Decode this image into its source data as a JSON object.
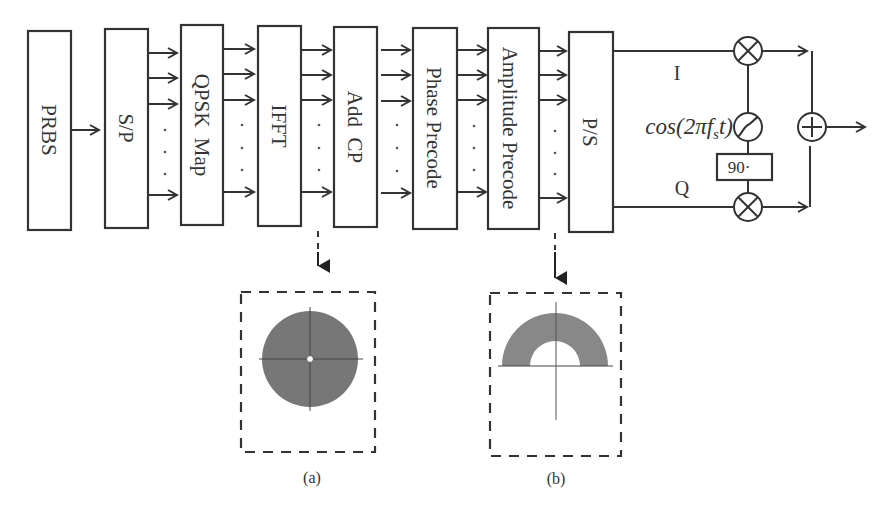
{
  "diagram": {
    "type": "block-diagram",
    "blocks": [
      {
        "id": "prbs",
        "label": "PRBS"
      },
      {
        "id": "sp",
        "label": "S/P"
      },
      {
        "id": "qpsk",
        "label": "QPSK  Map"
      },
      {
        "id": "ifft",
        "label": "IFFT"
      },
      {
        "id": "addcp",
        "label": "Add  CP"
      },
      {
        "id": "phase",
        "label": "Phase Precode"
      },
      {
        "id": "amp",
        "label": "Amplitude Precode"
      },
      {
        "id": "ps",
        "label": "P/S"
      }
    ],
    "iq": {
      "i_label": "I",
      "q_label": "Q",
      "oscillator_label": "cos(2πf",
      "oscillator_sub": "s",
      "oscillator_end": "t)",
      "phase_shift_label": "90·"
    },
    "insets": [
      {
        "id": "a",
        "caption": "(a)",
        "shape": "filled-disk-with-small-hole"
      },
      {
        "id": "b",
        "caption": "(b)",
        "shape": "upper-half-annulus"
      }
    ]
  }
}
